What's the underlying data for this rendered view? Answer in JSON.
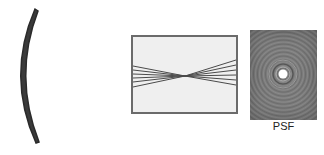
{
  "figure": {
    "lens": {
      "shape": "curved-segmented-lens",
      "fill_color": "#3a3a3a",
      "segment_color": "#ffffff"
    },
    "ray_diagram": {
      "background": "#efefef",
      "border_color": "#6b6b6b",
      "ray_color": "#4a4a4a",
      "ray_count": 6,
      "focus_point": "center"
    },
    "psf_panel": {
      "label": "PSF",
      "background": "#7a7a7a",
      "center_spot_color": "#ffffff"
    }
  }
}
